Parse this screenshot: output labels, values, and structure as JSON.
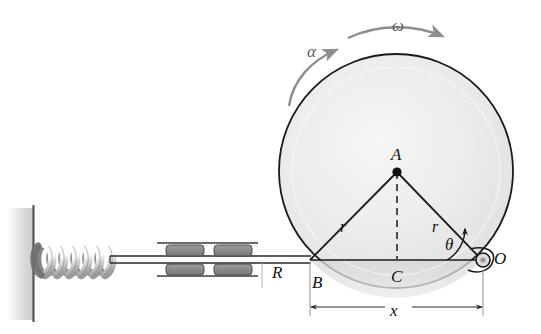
{
  "figure": {
    "domain_kind": "engineering-mechanism-diagram",
    "canvas": {
      "width": 541,
      "height": 334,
      "background": "#ffffff"
    },
    "colors": {
      "outline": "#1a1a1a",
      "disk_fill": "#e9e9e9",
      "disk_highlight": "#f4f4f4",
      "arrow_gray": "#8e8e8e",
      "label_text": "#111111",
      "bearing_block": "#8d8d8d",
      "wall_line": "#555555",
      "wall_shadow": "#cccccc",
      "dimension_line": "#9a9a9a",
      "spring_shade": "#6f6f6f"
    },
    "labels": {
      "point_a": "A",
      "point_b": "B",
      "point_c": "C",
      "point_o": "O",
      "radius_left": "r",
      "radius_right": "r",
      "disk_radius": "R",
      "displacement": "x",
      "angle": "θ",
      "angular_velocity": "ω",
      "angular_acceleration": "α"
    },
    "icons": {
      "omega_arrow": "curved-arrow-right-icon",
      "alpha_arrow": "curved-arrow-right-icon",
      "theta_arc": "angle-arc-icon",
      "pin_joint": "pin-joint-icon",
      "spring": "helical-spring-icon",
      "wall": "fixed-wall-hatch-icon",
      "slider_guide": "linear-bearing-icon",
      "dimension_x": "dimension-line-icon"
    },
    "geometry": {
      "disk": {
        "cx": 396,
        "cy": 171,
        "r": 117
      },
      "point_a": {
        "x": 397,
        "y": 172
      },
      "point_b": {
        "x": 310,
        "y": 260
      },
      "point_c": {
        "x": 397,
        "y": 260
      },
      "point_o": {
        "x": 482,
        "y": 260
      },
      "baseline_y": 260,
      "wall_x": 33,
      "spring_from_x": 38,
      "spring_to_x": 112,
      "rod_from_x": 112,
      "rod_to_x": 310,
      "bearing_left": 157,
      "bearing_right": 258
    }
  }
}
